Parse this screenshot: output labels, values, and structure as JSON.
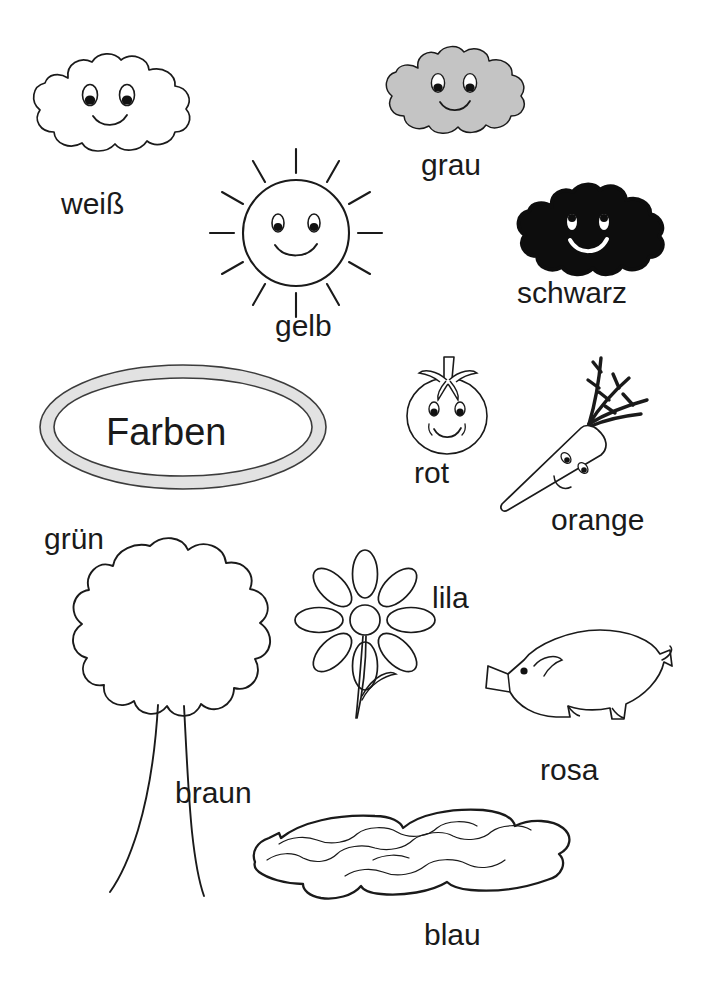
{
  "page": {
    "title": "Farben",
    "language": "de",
    "kind": "coloring-worksheet",
    "background_color": "#ffffff",
    "ink_color": "#1a1a1a"
  },
  "title_badge": {
    "text": "Farben",
    "shape": "oval",
    "ring_fill": "#e2e2e2",
    "ring_stroke": "#3c3c3c",
    "inner_fill": "#ffffff"
  },
  "items": [
    {
      "id": "weiss",
      "label": "weiß",
      "figure": "cloud-white",
      "figure_fill": "#ffffff",
      "figure_stroke": "#1a1a1a",
      "has_face": true
    },
    {
      "id": "grau",
      "label": "grau",
      "figure": "cloud-gray",
      "figure_fill": "#c4c4c4",
      "figure_stroke": "#1a1a1a",
      "has_face": true
    },
    {
      "id": "gelb",
      "label": "gelb",
      "figure": "sun",
      "figure_fill": "#ffffff",
      "figure_stroke": "#1a1a1a",
      "has_face": true,
      "ray_count": 12
    },
    {
      "id": "schwarz",
      "label": "schwarz",
      "figure": "cloud-black",
      "figure_fill": "#0d0d0d",
      "figure_stroke": "#0d0d0d",
      "has_face": true
    },
    {
      "id": "rot",
      "label": "rot",
      "figure": "tomato",
      "figure_fill": "#ffffff",
      "figure_stroke": "#1a1a1a",
      "has_face": true
    },
    {
      "id": "orange",
      "label": "orange",
      "figure": "carrot",
      "figure_fill": "#ffffff",
      "figure_stroke": "#1a1a1a",
      "has_face": true
    },
    {
      "id": "gruen",
      "label": "grün",
      "figure": "tree-crown",
      "figure_fill": "#ffffff",
      "figure_stroke": "#1a1a1a",
      "has_face": false
    },
    {
      "id": "braun",
      "label": "braun",
      "figure": "tree-trunk",
      "figure_fill": "#ffffff",
      "figure_stroke": "#1a1a1a",
      "has_face": false
    },
    {
      "id": "lila",
      "label": "lila",
      "figure": "flower",
      "figure_fill": "#ffffff",
      "figure_stroke": "#1a1a1a",
      "has_face": false,
      "petal_count": 8
    },
    {
      "id": "rosa",
      "label": "rosa",
      "figure": "pig",
      "figure_fill": "#ffffff",
      "figure_stroke": "#1a1a1a",
      "has_face": true
    },
    {
      "id": "blau",
      "label": "blau",
      "figure": "water-puddle",
      "figure_fill": "#ffffff",
      "figure_stroke": "#1a1a1a",
      "has_face": false
    }
  ]
}
